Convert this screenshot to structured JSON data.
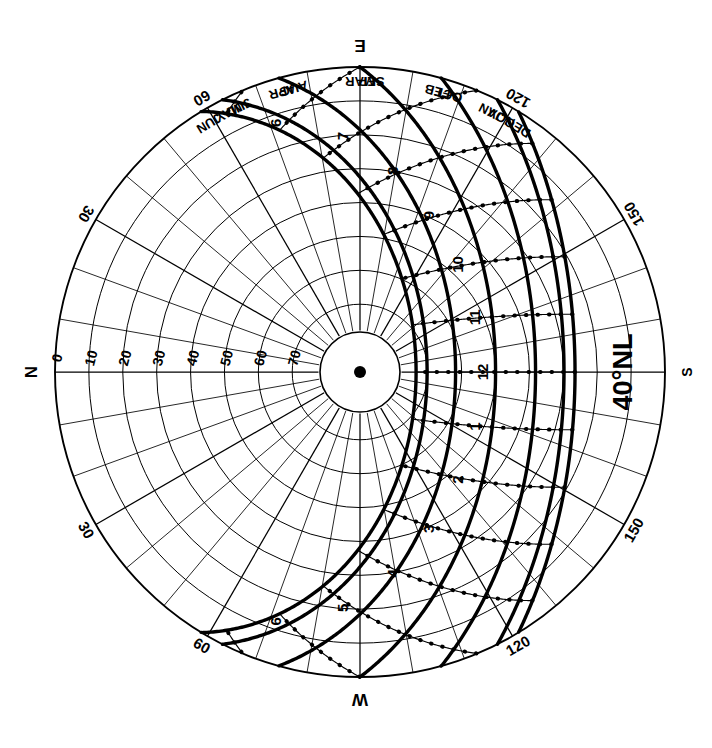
{
  "chart_data": {
    "type": "scatter",
    "subtype": "sun-path-polar-equidistant",
    "title": "40°NL",
    "latitude_label": "40°NL",
    "latitude_deg": 40,
    "projection": "equidistant polar (altitude linear in radius)",
    "orientation_note": "Chart rotated 90°: East at top, South at right, West at bottom, North at left",
    "grid": true,
    "legend_position": "none",
    "cardinals": [
      {
        "label": "E",
        "azimuth_deg": 90,
        "screen": "top"
      },
      {
        "label": "S",
        "azimuth_deg": 180,
        "screen": "right"
      },
      {
        "label": "W",
        "azimuth_deg": 270,
        "screen": "bottom"
      },
      {
        "label": "N",
        "azimuth_deg": 0,
        "screen": "left"
      }
    ],
    "altitude_axis": {
      "label": "Altitude",
      "ticks": [
        0,
        10,
        20,
        30,
        40,
        50,
        60,
        70,
        80
      ],
      "tick_labels": [
        "0",
        "10",
        "20",
        "30",
        "40",
        "50",
        "60",
        "70"
      ],
      "ring_step_deg": 10,
      "range": [
        0,
        90
      ]
    },
    "azimuth_axis": {
      "label": "Azimuth",
      "ring_step_deg": 10,
      "labeled_ticks": [
        30,
        60,
        120,
        150
      ],
      "labeled_tick_text": [
        "30",
        "60",
        "120",
        "150"
      ],
      "labels_mirrored_both_sides": true
    },
    "hour_lines": {
      "morning_labels": [
        "6",
        "7",
        "8",
        "9",
        "10",
        "11"
      ],
      "noon_label": "12",
      "afternoon_labels": [
        "1",
        "2",
        "3",
        "4",
        "5",
        "6"
      ],
      "all_labels": [
        "6",
        "7",
        "8",
        "9",
        "10",
        "11",
        "12",
        "1",
        "2",
        "3",
        "4",
        "5",
        "6"
      ]
    },
    "declination_curves": [
      {
        "months": "JUN",
        "labels": [
          "JUN"
        ],
        "declination_deg": 23.45,
        "noon_altitude_deg": 73.5
      },
      {
        "months": "MAY/JUL",
        "labels": [
          "MAY",
          "JUL"
        ],
        "declination_deg": 20.2,
        "noon_altitude_deg": 70.2
      },
      {
        "months": "APR/AUG",
        "labels": [
          "APR",
          "AUG"
        ],
        "declination_deg": 11.8,
        "noon_altitude_deg": 61.8
      },
      {
        "months": "MAR/SEP",
        "labels": [
          "MAR",
          "SEP"
        ],
        "declination_deg": 0.0,
        "noon_altitude_deg": 50.0
      },
      {
        "months": "FEB/OCT",
        "labels": [
          "FEB",
          "OCT"
        ],
        "declination_deg": -11.8,
        "noon_altitude_deg": 38.2
      },
      {
        "months": "JAN/NOV",
        "labels": [
          "JAN",
          "NOV"
        ],
        "declination_deg": -20.2,
        "noon_altitude_deg": 29.8
      },
      {
        "months": "DEC",
        "labels": [
          "DEC"
        ],
        "declination_deg": -23.45,
        "noon_altitude_deg": 26.5
      }
    ],
    "month_labels": [
      "JUN",
      "MAY",
      "JUL",
      "APR",
      "AUG",
      "MAR",
      "SEP",
      "FEB",
      "OCT",
      "JAN",
      "NOV",
      "DEC"
    ],
    "dotted_curves_note": "Dotted lines are hour-angle (solar time) curves crossing the declination curves",
    "center_marker": "zenith-dot",
    "colors": {
      "ink": "#000000",
      "paper": "#ffffff",
      "grid": "#1a1a1a"
    }
  },
  "labels": {
    "latitude": "40°NL",
    "north": "N",
    "east": "E",
    "south": "S",
    "west": "W",
    "alt_0": "0",
    "alt_10": "10",
    "alt_20": "20",
    "alt_30": "30",
    "alt_40": "40",
    "alt_50": "50",
    "alt_60": "60",
    "alt_70": "70",
    "az_30_top": "30",
    "az_60_top": "60",
    "az_120_top": "120",
    "az_150_top": "150",
    "az_30_bot": "30",
    "az_60_bot": "60",
    "az_120_bot": "120",
    "az_150_bot": "150",
    "h6am": "6",
    "h7am": "7",
    "h8am": "8",
    "h9am": "9",
    "h10am": "10",
    "h11am": "11",
    "h12": "12",
    "h1pm": "1",
    "h2pm": "2",
    "h3pm": "3",
    "h4pm": "4",
    "h5pm": "5",
    "h6pm": "6",
    "m_jun": "JUN",
    "m_may": "MAY",
    "m_jul": "JUL",
    "m_apr": "APR",
    "m_aug": "AUG",
    "m_mar": "MAR",
    "m_sep": "SEP",
    "m_feb": "FEB",
    "m_oct": "OCT",
    "m_jan": "JAN",
    "m_nov": "NOV",
    "m_dec": "DEC"
  }
}
